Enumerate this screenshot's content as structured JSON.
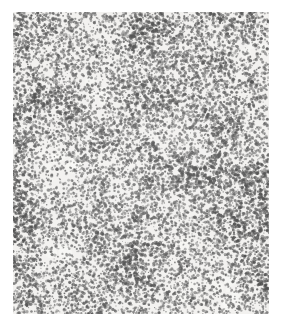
{
  "image": {
    "domain": "natural-image",
    "kind": "grayscale-micrograph",
    "description": "Dense stippled grain texture of dark silver-grain speckles on a light background, with mottled light and dark clustering throughout",
    "alt_text": "Grainy grayscale micrograph plate",
    "caption": "",
    "background_color": "#ffffff",
    "plate": {
      "left": 13,
      "top": 12,
      "width": 256,
      "height": 302,
      "base_tone": "#f2f1ef",
      "grain_color": "#4a4a4a",
      "dark_cluster_color": "#3a3a3a",
      "light_patch_color": "#fbfbfa"
    },
    "texture": {
      "type": "stipple-grain",
      "grain_count": 26000,
      "grain_radius_min": 0.55,
      "grain_radius_max": 1.75,
      "cluster_scale_coarse": 42,
      "cluster_scale_medium": 17,
      "cluster_scale_fine": 7,
      "density_mean": 0.5,
      "density_contrast": 0.42,
      "seed": 20240517
    },
    "marks": [
      {
        "name": "dark-speck",
        "x": 239,
        "y": 70,
        "radius": 2.1,
        "color": "#2b2b2b"
      },
      {
        "name": "dark-speck",
        "x": 232,
        "y": 244,
        "radius": 1.6,
        "color": "#303030"
      },
      {
        "name": "dark-speck",
        "x": 84,
        "y": 44,
        "radius": 1.5,
        "color": "#333333"
      }
    ]
  }
}
